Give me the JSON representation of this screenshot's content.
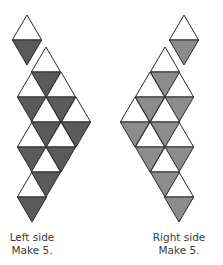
{
  "colors": {
    "stroke": "#2a2a2a",
    "white": "#ffffff",
    "left_fill": "#5a5a5a",
    "right_fill": "#8c8c8c"
  },
  "geometry": {
    "side": 29.3,
    "height": 25,
    "mirror_axis_sum": 211
  },
  "left": {
    "caption_line1": "Left side",
    "caption_line2": "Make 5.",
    "small_piece": [
      {
        "dir": "up",
        "x": 27,
        "y": 15,
        "fill": "white"
      },
      {
        "dir": "down",
        "x": 27,
        "y": 40,
        "fill": "shaded"
      }
    ],
    "big_piece": [
      {
        "dir": "up",
        "x": 46,
        "y": 47,
        "fill": "white"
      },
      {
        "dir": "up",
        "x": 32,
        "y": 72,
        "fill": "white"
      },
      {
        "dir": "down",
        "x": 46,
        "y": 72,
        "fill": "shaded"
      },
      {
        "dir": "up",
        "x": 61,
        "y": 72,
        "fill": "white"
      },
      {
        "dir": "down",
        "x": 32,
        "y": 97,
        "fill": "shaded"
      },
      {
        "dir": "up",
        "x": 46,
        "y": 97,
        "fill": "white"
      },
      {
        "dir": "down",
        "x": 61,
        "y": 97,
        "fill": "shaded"
      },
      {
        "dir": "up",
        "x": 76,
        "y": 97,
        "fill": "white"
      },
      {
        "dir": "up",
        "x": 32,
        "y": 122,
        "fill": "white"
      },
      {
        "dir": "down",
        "x": 46,
        "y": 122,
        "fill": "shaded"
      },
      {
        "dir": "up",
        "x": 61,
        "y": 122,
        "fill": "white"
      },
      {
        "dir": "down",
        "x": 76,
        "y": 122,
        "fill": "shaded"
      },
      {
        "dir": "down",
        "x": 32,
        "y": 147,
        "fill": "shaded"
      },
      {
        "dir": "up",
        "x": 46,
        "y": 147,
        "fill": "white"
      },
      {
        "dir": "down",
        "x": 61,
        "y": 147,
        "fill": "shaded"
      },
      {
        "dir": "up",
        "x": 32,
        "y": 172,
        "fill": "white"
      },
      {
        "dir": "down",
        "x": 46,
        "y": 172,
        "fill": "shaded"
      },
      {
        "dir": "down",
        "x": 32,
        "y": 197,
        "fill": "shaded"
      }
    ]
  },
  "right": {
    "caption_line1": "Right side",
    "caption_line2": "Make 5."
  }
}
